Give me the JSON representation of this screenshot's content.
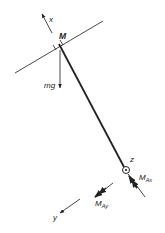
{
  "figure": {
    "type": "free-body-diagram",
    "colors": {
      "stroke": "#222222",
      "background": "#ffffff"
    },
    "labels": {
      "x_axis": "x",
      "y_axis": "y",
      "z_axis": "z",
      "mass": "M",
      "weight": "mg",
      "moment_ax": {
        "main": "M",
        "sub": "Ax"
      },
      "moment_ay": {
        "main": "M",
        "sub": "Ay"
      }
    }
  }
}
